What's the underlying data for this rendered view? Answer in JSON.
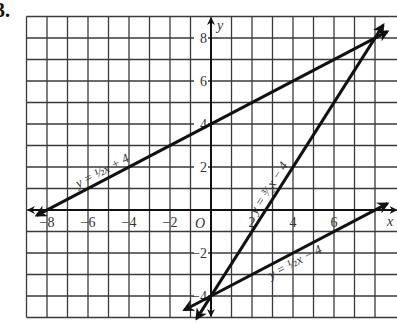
{
  "problem": {
    "number": "3."
  },
  "chart_data": {
    "type": "line",
    "title": "",
    "xlabel": "x",
    "ylabel": "y",
    "origin_label": "O",
    "xlim": [
      -9,
      8.9
    ],
    "ylim": [
      -5,
      9
    ],
    "grid": true,
    "x_ticks": [
      -8,
      -6,
      -4,
      -2,
      2,
      4,
      6
    ],
    "x_tick_labels": [
      "−8",
      "−6",
      "−4",
      "−2",
      "2",
      "4",
      "6"
    ],
    "y_ticks": [
      8,
      6,
      4,
      2,
      -2,
      -4
    ],
    "y_tick_labels": [
      "8",
      "6",
      "4",
      "2",
      "−2",
      "−4"
    ],
    "series": [
      {
        "name": "y = ½x + 4",
        "label": "y = ½x + 4",
        "slope": 0.5,
        "intercept": 4,
        "x": [
          -8.5,
          8.6
        ],
        "y": [
          -0.25,
          8.3
        ],
        "arrows": "both"
      },
      {
        "name": "y = ³⁄₂x − 4",
        "label": "y = ³⁄₂x − 4",
        "slope": 1.5,
        "intercept": -4,
        "x": [
          -0.7,
          8.4
        ],
        "y": [
          -5.05,
          8.6
        ],
        "arrows": "both"
      },
      {
        "name": "y = ½x − 4",
        "label": "y = ½x − 4",
        "slope": 0.5,
        "intercept": -4,
        "x": [
          -1.3,
          8.6
        ],
        "y": [
          -4.65,
          0.3
        ],
        "arrows": "both"
      }
    ],
    "intersections": [
      {
        "x": 8,
        "y": 8
      },
      {
        "x": 0,
        "y": -4
      }
    ]
  }
}
